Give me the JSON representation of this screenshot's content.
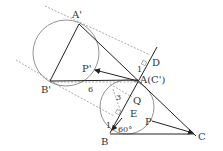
{
  "diagram": {
    "type": "geometry-rotation",
    "points": {
      "A_prime": {
        "label": "A'",
        "x": 79,
        "y": 24
      },
      "B_prime": {
        "label": "B'",
        "x": 50,
        "y": 81
      },
      "A": {
        "label": "A(C')",
        "x": 138,
        "y": 80
      },
      "B": {
        "label": "B",
        "x": 110,
        "y": 133
      },
      "C": {
        "label": "C",
        "x": 196,
        "y": 136
      },
      "P_prime": {
        "label": "P'",
        "x": 95,
        "y": 70
      },
      "P": {
        "label": "P",
        "x": 152,
        "y": 120
      },
      "Q": {
        "label": "Q",
        "x": 132,
        "y": 97
      },
      "D": {
        "label": "D",
        "x": 156,
        "y": 50
      },
      "E": {
        "label": "E",
        "x": 122,
        "y": 114
      }
    },
    "measurements": {
      "len_6": "6",
      "len_3": "3",
      "angle_1_top": "1",
      "angle_1_bottom": "1",
      "angle_60": "60°"
    },
    "circles": [
      {
        "cx": 66,
        "cy": 53,
        "r": 33
      },
      {
        "cx": 127,
        "cy": 107,
        "r": 27
      }
    ]
  }
}
